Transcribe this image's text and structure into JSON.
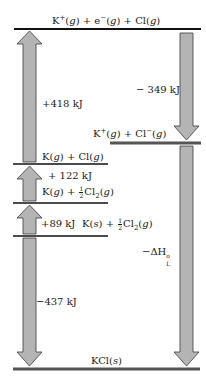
{
  "diagram": {
    "colors": {
      "arrow_fill": "#b4b4b4",
      "arrow_stroke": "#3a3a3a",
      "level_black": "#111111",
      "level_gray": "#555555"
    },
    "levels": [
      {
        "id": "k-plus-e-cl",
        "label": "K⁺(g) + e⁻(g) + Cl(g)",
        "y": 29
      },
      {
        "id": "k-plus-cl-minus",
        "label": "K⁺(g) + Cl⁻(g)",
        "y": 143
      },
      {
        "id": "k-g-cl-g",
        "label": "K(g) + Cl(g)",
        "y": 164
      },
      {
        "id": "k-g-half-cl2",
        "label": "K(g) + ½Cl₂(g)",
        "y": 203
      },
      {
        "id": "k-s-half-cl2",
        "label": "K(s) + ½Cl₂(g)",
        "y": 236
      },
      {
        "id": "kcl-s",
        "label": "KCl(s)",
        "y": 369
      }
    ],
    "arrows": [
      {
        "id": "ionization",
        "direction": "up",
        "label": "+418 kJ"
      },
      {
        "id": "electron-affinity",
        "direction": "down",
        "label": "−349 kJ"
      },
      {
        "id": "dissociation",
        "direction": "up",
        "label": "+122 kJ"
      },
      {
        "id": "sublimation",
        "direction": "up",
        "label": "+89 kJ"
      },
      {
        "id": "formation",
        "direction": "down",
        "label": "−437 kJ"
      },
      {
        "id": "lattice",
        "direction": "down",
        "label": "−ΔH°L"
      }
    ],
    "text": {
      "ionization_label": "+418 kJ",
      "ea_label": "− 349 kJ",
      "dissociation_label": "+ 122 kJ",
      "sublimation_label": "+89 kJ",
      "formation_label": "−437 kJ",
      "lattice_prefix": "−ΔH",
      "lattice_sup": "o",
      "lattice_sub": "L",
      "top_k": "K",
      "top_k_sup": "+",
      "g": "g",
      "s": "s",
      "e": "e",
      "e_sup": "−",
      "cl": "Cl",
      "cl_sup": "−",
      "cl2": "Cl",
      "cl2_sub": "2",
      "half_num": "1",
      "half_den": "2",
      "kcl": "KCl",
      "plus": "+"
    }
  }
}
